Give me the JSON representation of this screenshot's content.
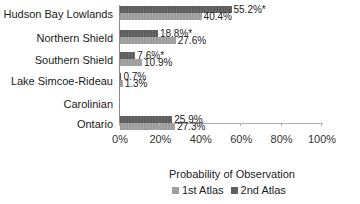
{
  "chart_data": {
    "type": "bar",
    "orientation": "horizontal",
    "title": "",
    "xlabel": "Probability of Observation",
    "ylabel": "",
    "xlim": [
      0,
      100
    ],
    "x_ticks": [
      "0%",
      "20%",
      "40%",
      "60%",
      "80%",
      "100%"
    ],
    "categories": [
      "Hudson Bay Lowlands",
      "Northern Shield",
      "Southern Shield",
      "Lake Simcoe-Rideau",
      "Carolinian",
      "Ontario"
    ],
    "series": [
      {
        "name": "1st Atlas",
        "color": "#a0a0a0",
        "values": [
          40.4,
          27.6,
          10.9,
          1.3,
          null,
          27.3
        ],
        "labels": [
          "40.4%",
          "27.6%",
          "10.9%",
          "1.3%",
          "",
          "27.3%"
        ]
      },
      {
        "name": "2nd Atlas",
        "color": "#606060",
        "values": [
          55.2,
          18.8,
          7.6,
          0.7,
          null,
          25.9
        ],
        "labels": [
          "55.2%*",
          "18.8%*",
          "7.6%*",
          "0.7%",
          "",
          "25.9%"
        ]
      }
    ],
    "legend": [
      "1st Atlas",
      "2nd Atlas"
    ],
    "legend_position": "bottom",
    "grid": false
  }
}
